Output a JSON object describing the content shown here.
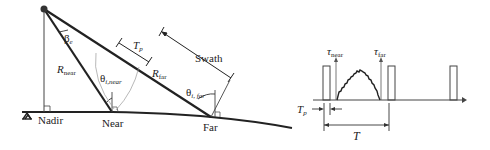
{
  "geometry_diagram": {
    "labels": {
      "beta": "β",
      "beta_sub": "e",
      "r_near": "R",
      "r_near_sub": "near",
      "r_far": "R",
      "r_far_sub": "far",
      "theta_near": "θ",
      "theta_near_sub": "i,near",
      "theta_far": "θ",
      "theta_far_sub": "i, far",
      "tp": "T",
      "tp_sub": "p",
      "swath": "Swath",
      "nadir": "Nadir",
      "near": "Near",
      "far": "Far"
    }
  },
  "timing_diagram": {
    "labels": {
      "tau_near": "τ",
      "tau_near_sub": "near",
      "tau_far": "τ",
      "tau_far_sub": "far",
      "tp": "T",
      "tp_sub": "p",
      "period": "T"
    }
  },
  "colors": {
    "ink": "#222222",
    "light_ink": "#888888"
  }
}
